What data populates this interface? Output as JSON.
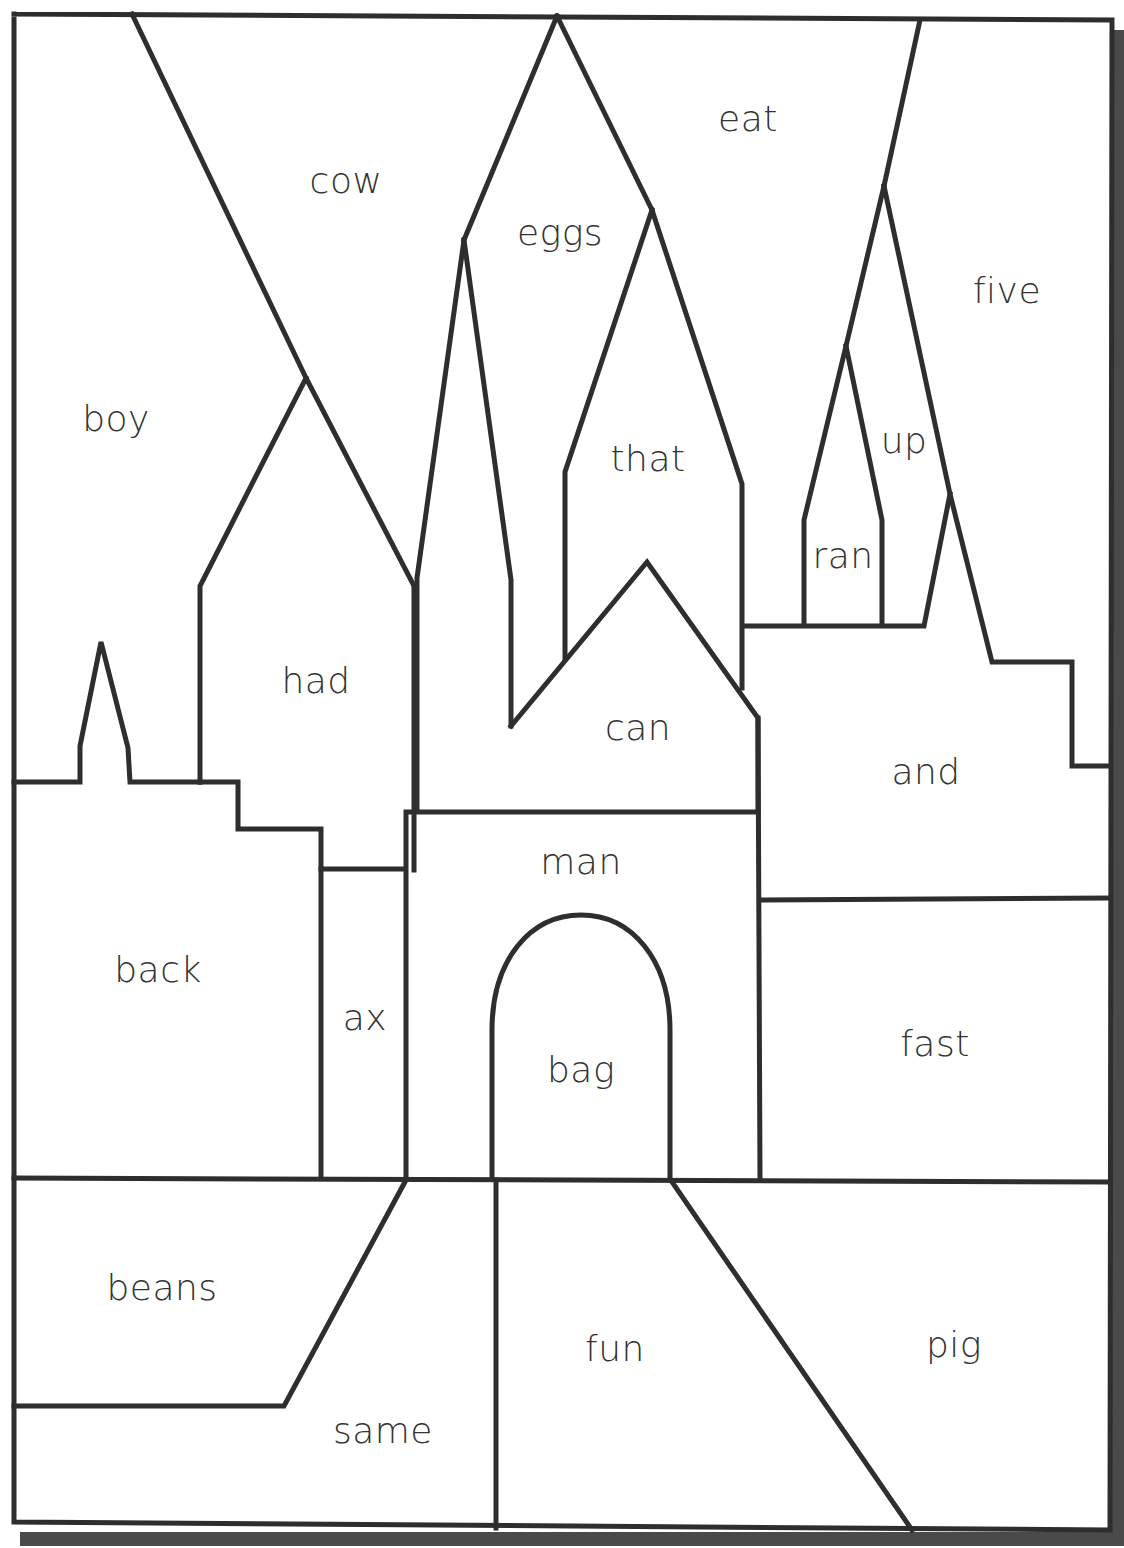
{
  "colors": {
    "line": "#2e2e2e",
    "text": "#333333",
    "paper": "#ffffff",
    "shadow": "#4a4a4a"
  },
  "words": [
    {
      "id": "cow",
      "text": "cow",
      "x": 346,
      "y": 180
    },
    {
      "id": "eat",
      "text": "eat",
      "x": 748,
      "y": 118
    },
    {
      "id": "eggs",
      "text": "eggs",
      "x": 560,
      "y": 232
    },
    {
      "id": "five",
      "text": "five",
      "x": 1007,
      "y": 290
    },
    {
      "id": "boy",
      "text": "boy",
      "x": 116,
      "y": 418
    },
    {
      "id": "up",
      "text": "up",
      "x": 904,
      "y": 440
    },
    {
      "id": "that",
      "text": "that",
      "x": 648,
      "y": 458
    },
    {
      "id": "ran",
      "text": "ran",
      "x": 843,
      "y": 555
    },
    {
      "id": "had",
      "text": "had",
      "x": 316,
      "y": 680
    },
    {
      "id": "can",
      "text": "can",
      "x": 638,
      "y": 727
    },
    {
      "id": "and",
      "text": "and",
      "x": 926,
      "y": 771
    },
    {
      "id": "man",
      "text": "man",
      "x": 581,
      "y": 861
    },
    {
      "id": "back",
      "text": "back",
      "x": 158,
      "y": 969
    },
    {
      "id": "ax",
      "text": "ax",
      "x": 365,
      "y": 1017
    },
    {
      "id": "fast",
      "text": "fast",
      "x": 935,
      "y": 1043
    },
    {
      "id": "bag",
      "text": "bag",
      "x": 581,
      "y": 1069
    },
    {
      "id": "beans",
      "text": "beans",
      "x": 162,
      "y": 1287
    },
    {
      "id": "fun",
      "text": "fun",
      "x": 615,
      "y": 1348
    },
    {
      "id": "pig",
      "text": "pig",
      "x": 954,
      "y": 1344
    },
    {
      "id": "same",
      "text": "same",
      "x": 383,
      "y": 1430
    }
  ]
}
